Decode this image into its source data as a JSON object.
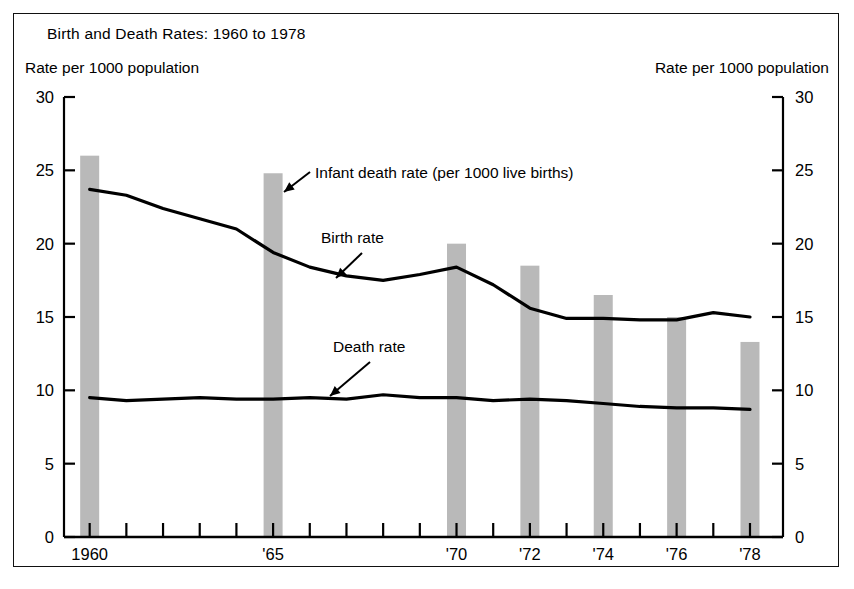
{
  "figure": {
    "title": "Birth and Death Rates: 1960 to 1978",
    "ylabel_left": "Rate per 1000 population",
    "ylabel_right": "Rate per 1000 population"
  },
  "annotations": {
    "infant": "Infant death rate (per 1000 live births)",
    "birth": "Birth rate",
    "death": "Death rate"
  },
  "axis": {
    "y_ticks": [
      0,
      5,
      10,
      15,
      20,
      25,
      30
    ],
    "y_tick_labels": [
      "0",
      "5",
      "10",
      "15",
      "20",
      "25",
      "30"
    ],
    "x_tick_labels": [
      {
        "year": 1960,
        "label": "1960"
      },
      {
        "year": 1965,
        "label": "'65"
      },
      {
        "year": 1970,
        "label": "'70"
      },
      {
        "year": 1972,
        "label": "'72"
      },
      {
        "year": 1974,
        "label": "'74"
      },
      {
        "year": 1976,
        "label": "'76"
      },
      {
        "year": 1978,
        "label": "'78"
      }
    ]
  },
  "colors": {
    "bar_fill": "#b9b9b9",
    "line": "#000000",
    "axis": "#000000",
    "background": "#ffffff"
  },
  "chart_data": {
    "type": "bar",
    "title": "Birth and Death Rates: 1960 to 1978",
    "xlabel": "",
    "ylabel": "Rate per 1000 population",
    "ylim": [
      0,
      30
    ],
    "xlim": [
      1959.3,
      1978.9
    ],
    "grid": false,
    "legend": "inline annotations",
    "x": [
      1960,
      1961,
      1962,
      1963,
      1964,
      1965,
      1966,
      1967,
      1968,
      1969,
      1970,
      1971,
      1972,
      1973,
      1974,
      1975,
      1976,
      1977,
      1978
    ],
    "bars": {
      "name": "Infant death rate (per 1000 live births)",
      "categories": [
        1960,
        1965,
        1970,
        1972,
        1974,
        1976,
        1978
      ],
      "values": [
        26.0,
        24.8,
        20.0,
        18.5,
        16.5,
        15.0,
        13.3
      ]
    },
    "series": [
      {
        "name": "Birth rate",
        "x": [
          1960,
          1961,
          1962,
          1963,
          1964,
          1965,
          1966,
          1967,
          1968,
          1969,
          1970,
          1971,
          1972,
          1973,
          1974,
          1975,
          1976,
          1977,
          1978
        ],
        "values": [
          23.7,
          23.3,
          22.4,
          21.7,
          21.0,
          19.4,
          18.4,
          17.8,
          17.5,
          17.9,
          18.4,
          17.2,
          15.6,
          14.9,
          14.9,
          14.8,
          14.8,
          15.3,
          15.0
        ]
      },
      {
        "name": "Death rate",
        "x": [
          1960,
          1961,
          1962,
          1963,
          1964,
          1965,
          1966,
          1967,
          1968,
          1969,
          1970,
          1971,
          1972,
          1973,
          1974,
          1975,
          1976,
          1977,
          1978
        ],
        "values": [
          9.5,
          9.3,
          9.4,
          9.5,
          9.4,
          9.4,
          9.5,
          9.4,
          9.7,
          9.5,
          9.5,
          9.3,
          9.4,
          9.3,
          9.1,
          8.9,
          8.8,
          8.8,
          8.7
        ]
      }
    ]
  }
}
